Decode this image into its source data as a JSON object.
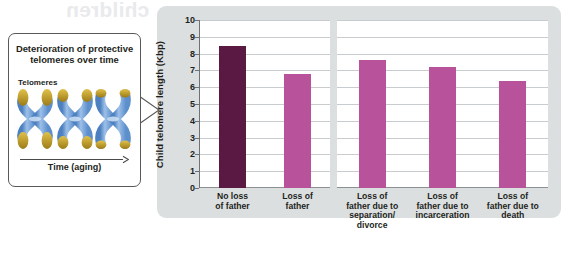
{
  "page": {
    "ghost_text": "children",
    "background_color": "#ffffff"
  },
  "callout": {
    "title": "Deterioration of protective telomeres over time",
    "telomeres_label": "Telomeres",
    "time_axis_label": "Time (aging)",
    "chromosome_color": "#6f9fd8",
    "telomere_cap_color": "#c9a227",
    "border_color": "#58595b",
    "chromosomes": [
      {
        "name": "chromosome-young",
        "cap_size": "large"
      },
      {
        "name": "chromosome-middle",
        "cap_size": "medium"
      },
      {
        "name": "chromosome-old",
        "cap_size": "small"
      }
    ]
  },
  "chart_data": {
    "type": "bar",
    "title": "",
    "xlabel": "",
    "ylabel": "Child telomere length (Kbp)",
    "ylim": [
      0,
      10
    ],
    "yticks": [
      0,
      1,
      2,
      3,
      4,
      5,
      6,
      7,
      8,
      9,
      10
    ],
    "ytick_labels": [
      "0",
      "1",
      "2",
      "3",
      "4",
      "5",
      "6",
      "7",
      "8",
      "9",
      "10"
    ],
    "grid": true,
    "legend": "none",
    "categories": [
      "No loss of father",
      "Loss of father",
      "Loss of father due to separation/ divorce",
      "Loss of father due to incarceration",
      "Loss of father due to death"
    ],
    "category_lines": [
      [
        "No loss",
        "of father"
      ],
      [
        "Loss of",
        "father"
      ],
      [
        "Loss of",
        "father due to",
        "separation/",
        "divorce"
      ],
      [
        "Loss of",
        "father due to",
        "incarceration"
      ],
      [
        "Loss of",
        "father due to",
        "death"
      ]
    ],
    "values": [
      8.45,
      6.8,
      7.6,
      7.2,
      6.35
    ],
    "bar_colors": [
      "#5a1942",
      "#b8529a",
      "#b8529a",
      "#b8529a",
      "#b8529a"
    ],
    "groups": [
      {
        "name": "reference",
        "categories": [
          0,
          1
        ]
      },
      {
        "name": "cause-of-loss",
        "categories": [
          2,
          3,
          4
        ]
      }
    ],
    "panel_color": "#dcdfe0",
    "plot_background": "#ffffff",
    "gridline_color": "#c9ccce",
    "axis_color": "#6f7275"
  }
}
